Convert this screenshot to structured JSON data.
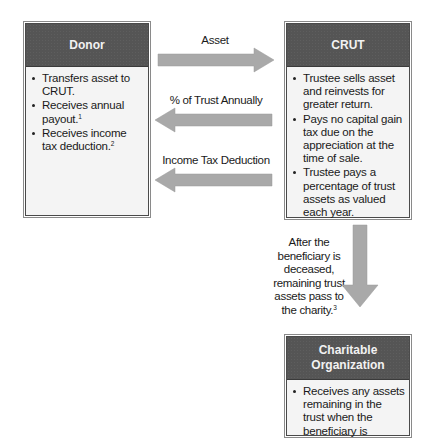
{
  "colors": {
    "header_fill": "#555555",
    "body_fill": "#f4f4f4",
    "arrow_fill": "#a9a9a9"
  },
  "donor": {
    "title": "Donor",
    "items": [
      {
        "text": "Transfers asset to CRUT.",
        "note": ""
      },
      {
        "text": "Receives annual payout.",
        "note": "1"
      },
      {
        "text": "Receives income tax deduction.",
        "note": "2"
      }
    ]
  },
  "crut": {
    "title": "CRUT",
    "items": [
      {
        "text": "Trustee sells asset and reinvests for greater return.",
        "note": ""
      },
      {
        "text": "Pays no capital gain tax due on the appreciation at the time of sale.",
        "note": ""
      },
      {
        "text": "Trustee pays a percentage of trust assets as valued each year.",
        "note": ""
      }
    ]
  },
  "charity": {
    "title_line1": "Charitable",
    "title_line2": "Organization",
    "items": [
      {
        "text": "Receives any assets remaining in the trust when the beneficiary is",
        "note": ""
      }
    ]
  },
  "flows": [
    {
      "label": "Asset",
      "direction": "right",
      "from": "Donor",
      "to": "CRUT"
    },
    {
      "label": "% of Trust Annually",
      "direction": "left",
      "from": "CRUT",
      "to": "Donor"
    },
    {
      "label": "Income Tax Deduction",
      "direction": "left",
      "from": "CRUT",
      "to": "Donor"
    },
    {
      "label": "After the beneficiary is deceased, remaining trust assets pass to the charity.",
      "note": "3",
      "direction": "down",
      "from": "CRUT",
      "to": "Charitable Organization"
    }
  ],
  "down_caption": {
    "line1": "After the",
    "line2": "beneficiary is",
    "line3": "deceased,",
    "line4": "remaining trust",
    "line5": "assets pass to",
    "line6": "the charity.",
    "note": "3"
  }
}
